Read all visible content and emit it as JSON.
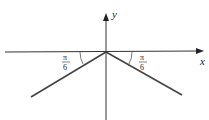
{
  "diagram": {
    "x_label": "x",
    "y_label": "y",
    "left_angle": {
      "numerator": "π",
      "denominator": "6"
    },
    "right_angle": {
      "numerator": "π",
      "denominator": "6"
    },
    "colors": {
      "axis": "#333333",
      "line": "#444444"
    }
  }
}
